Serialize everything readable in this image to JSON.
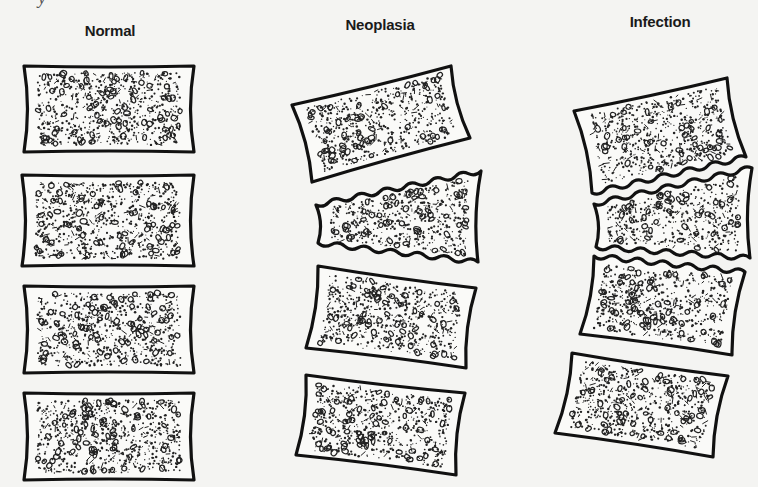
{
  "figure": {
    "scan_fragment": "y",
    "background": "#f4f4f2",
    "outline_color": "#111111",
    "texture_color": "#222222",
    "fill_color": "#fafaf8",
    "columns": [
      {
        "label": "Normal",
        "label_pos": [
          110,
          22
        ],
        "description": "Four normal vertebral bodies with intact, smooth endplates and preserved disc spaces",
        "vertebrae": [
          {
            "shape": "rect",
            "corners": [
              [
                24,
                66
              ],
              [
                194,
                66
              ],
              [
                194,
                152
              ],
              [
                24,
                152
              ]
            ],
            "endplate_top": "smooth",
            "endplate_bottom": "smooth"
          },
          {
            "shape": "rect",
            "corners": [
              [
                22,
                175
              ],
              [
                194,
                175
              ],
              [
                194,
                266
              ],
              [
                22,
                266
              ]
            ],
            "endplate_top": "smooth",
            "endplate_bottom": "smooth"
          },
          {
            "shape": "rect",
            "corners": [
              [
                24,
                286
              ],
              [
                194,
                286
              ],
              [
                194,
                373
              ],
              [
                24,
                373
              ]
            ],
            "endplate_top": "smooth",
            "endplate_bottom": "smooth"
          },
          {
            "shape": "rect",
            "corners": [
              [
                24,
                393
              ],
              [
                194,
                393
              ],
              [
                194,
                480
              ],
              [
                24,
                480
              ]
            ],
            "endplate_top": "smooth",
            "endplate_bottom": "smooth"
          }
        ]
      },
      {
        "label": "Neoplasia",
        "label_pos": [
          380,
          16
        ],
        "description": "Wedge collapse of a vertebral body with irregular endplates; adjacent disc spaces preserved",
        "vertebrae": [
          {
            "shape": "quad",
            "corners": [
              [
                292,
                105
              ],
              [
                451,
                66
              ],
              [
                470,
                138
              ],
              [
                312,
                182
              ]
            ],
            "endplate_top": "smooth",
            "endplate_bottom": "smooth"
          },
          {
            "shape": "wedge",
            "corners": [
              [
                316,
                205
              ],
              [
                481,
                171
              ],
              [
                478,
                262
              ],
              [
                318,
                243
              ]
            ],
            "endplate_top": "wavy",
            "endplate_bottom": "wavy"
          },
          {
            "shape": "quad",
            "corners": [
              [
                318,
                266
              ],
              [
                476,
                288
              ],
              [
                466,
                368
              ],
              [
                306,
                348
              ]
            ],
            "endplate_top": "smooth",
            "endplate_bottom": "smooth"
          },
          {
            "shape": "quad",
            "corners": [
              [
                306,
                375
              ],
              [
                465,
                393
              ],
              [
                456,
                475
              ],
              [
                296,
                455
              ]
            ],
            "endplate_top": "smooth",
            "endplate_bottom": "smooth"
          }
        ]
      },
      {
        "label": "Infection",
        "label_pos": [
          660,
          13
        ],
        "description": "Disc space destruction with irregular opposing endplates across adjacent vertebrae",
        "vertebrae": [
          {
            "shape": "quad",
            "corners": [
              [
                574,
                111
              ],
              [
                727,
                78
              ],
              [
                746,
                157
              ],
              [
                592,
                193
              ]
            ],
            "endplate_top": "smooth",
            "endplate_bottom": "wavy"
          },
          {
            "shape": "quad",
            "corners": [
              [
                594,
                204
              ],
              [
                752,
                168
              ],
              [
                750,
                258
              ],
              [
                596,
                247
              ]
            ],
            "endplate_top": "wavy",
            "endplate_bottom": "wavy"
          },
          {
            "shape": "quad",
            "corners": [
              [
                594,
                256
              ],
              [
                745,
                272
              ],
              [
                732,
                355
              ],
              [
                580,
                334
              ]
            ],
            "endplate_top": "wavy",
            "endplate_bottom": "smooth"
          },
          {
            "shape": "quad",
            "corners": [
              [
                572,
                353
              ],
              [
                728,
                376
              ],
              [
                713,
                457
              ],
              [
                555,
                433
              ]
            ],
            "endplate_top": "smooth",
            "endplate_bottom": "smooth"
          }
        ]
      }
    ]
  }
}
